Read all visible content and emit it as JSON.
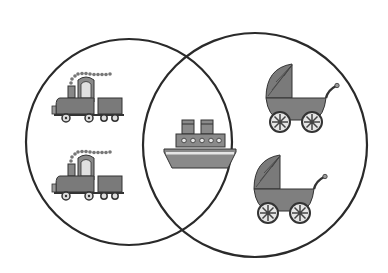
{
  "diagram": {
    "type": "venn",
    "colors": {
      "background": "#ffffff",
      "outline": "#2a2a2a",
      "fill_mid": "#8a8a8a",
      "fill_dark": "#666666",
      "fill_light": "#d9d9d9"
    },
    "sets": [
      {
        "name": "left-set",
        "items": [
          "train",
          "train"
        ]
      },
      {
        "name": "right-set",
        "items": [
          "baby-carriage",
          "baby-carriage"
        ]
      }
    ],
    "intersection": {
      "items": [
        "ship"
      ]
    }
  }
}
